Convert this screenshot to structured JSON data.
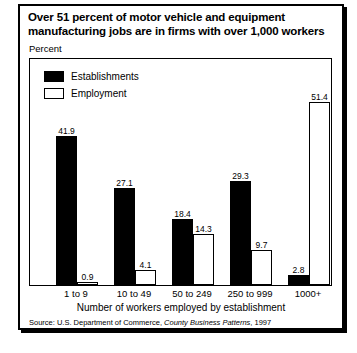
{
  "figure": {
    "title_line1": "Over 51 percent of motor vehicle and equipment",
    "title_line2": "manufacturing jobs are in firms with over 1,000 workers",
    "y_unit": "Percent",
    "x_title": "Number of workers employed by establishment",
    "source_prefix": "Source: U.S. Department of Commerce, ",
    "source_italic": "County Business Patterns",
    "source_suffix": ", 1997"
  },
  "chart_data": {
    "type": "bar",
    "title": "Over 51 percent of motor vehicle and equipment manufacturing jobs are in firms with over 1,000 workers",
    "xlabel": "Number of workers employed by establishment",
    "ylabel": "Percent",
    "ylim": [
      0,
      55
    ],
    "grid": false,
    "legend_position": "top-left",
    "categories": [
      "1 to 9",
      "10 to 49",
      "50 to 249",
      "250 to 999",
      "1000+"
    ],
    "series": [
      {
        "name": "Establishments",
        "color": "#000000",
        "style": "solid",
        "values": [
          41.9,
          27.1,
          18.4,
          29.3,
          2.8
        ],
        "labels": [
          "41.9",
          "27.1",
          "18.4",
          "29.3",
          "2.8"
        ]
      },
      {
        "name": "Employment",
        "color": "#ffffff",
        "style": "hollow",
        "values": [
          0.9,
          4.1,
          14.3,
          9.7,
          51.4
        ],
        "labels": [
          "0.9",
          "4.1",
          "14.3",
          "9.7",
          "51.4"
        ]
      }
    ]
  }
}
